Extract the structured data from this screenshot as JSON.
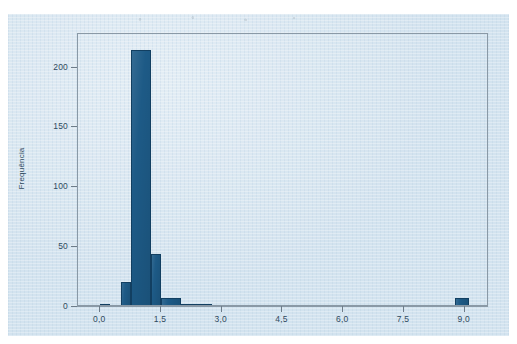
{
  "figure": {
    "background_color": "#d3e3ef",
    "frame_color": "#8a99a6",
    "bar_color": "#1d5a86",
    "bar_edge_color": "#123f61",
    "text_color": "#2f4a60"
  },
  "chart_data": {
    "type": "bar",
    "chart_subtype": "histogram",
    "title": "",
    "subtitle": "",
    "xlabel": "",
    "ylabel": "Frequência",
    "xlim": [
      -0.55,
      9.6
    ],
    "ylim": [
      0,
      228
    ],
    "grid": false,
    "legend": null,
    "legend_position": "none",
    "decimal_separator": ",",
    "x_tick_labels": [
      "0,0",
      "1,5",
      "3,0",
      "4,5",
      "6,0",
      "7,5",
      "9,0"
    ],
    "x_tick_values": [
      0.0,
      1.5,
      3.0,
      4.5,
      6.0,
      7.5,
      9.0
    ],
    "y_tick_labels": [
      "0",
      "50",
      "100",
      "150",
      "200"
    ],
    "y_tick_values": [
      0,
      50,
      100,
      150,
      200
    ],
    "bin_width": 0.25,
    "categories": [
      "0,00-0,25",
      "0,50-0,75",
      "0,75-1,25",
      "1,25-1,50",
      "1,50-2,00",
      "2,00-2,75",
      "8,75-9,10"
    ],
    "values": [
      1,
      19,
      213,
      43,
      6,
      1,
      6
    ],
    "bins": [
      {
        "label": "0,00-0,25",
        "x_start": 0.0,
        "x_end": 0.25,
        "value": 1
      },
      {
        "label": "0,50-0,75",
        "x_start": 0.5,
        "x_end": 0.75,
        "value": 19
      },
      {
        "label": "0,75-1,25",
        "x_start": 0.75,
        "x_end": 1.25,
        "value": 213
      },
      {
        "label": "1,25-1,50",
        "x_start": 1.25,
        "x_end": 1.5,
        "value": 43
      },
      {
        "label": "1,50-2,00",
        "x_start": 1.5,
        "x_end": 2.0,
        "value": 6
      },
      {
        "label": "2,00-2,75",
        "x_start": 2.0,
        "x_end": 2.75,
        "value": 1
      },
      {
        "label": "8,75-9,10",
        "x_start": 8.75,
        "x_end": 9.1,
        "value": 6
      }
    ]
  }
}
